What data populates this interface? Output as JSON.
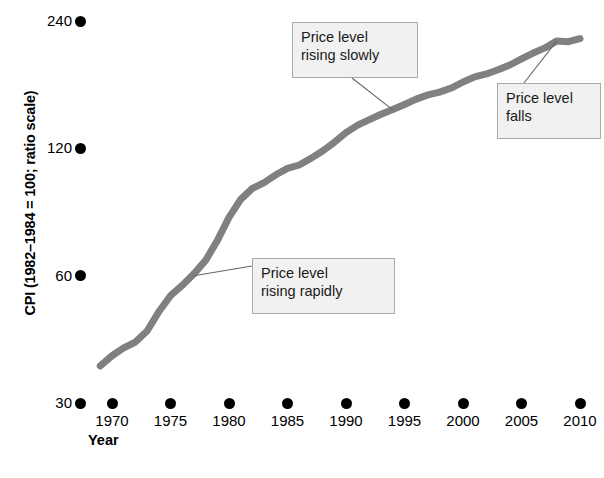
{
  "chart_data": {
    "type": "line",
    "title": "",
    "xlabel": "Year",
    "ylabel": "CPI (1982–1984 = 100; ratio scale)",
    "yscale": "log",
    "ylim": [
      30,
      260
    ],
    "xlim": [
      1969,
      2011
    ],
    "grid": false,
    "legend": null,
    "series": [
      {
        "name": "CPI",
        "color": "#808080",
        "x": [
          1969,
          1970,
          1971,
          1972,
          1973,
          1974,
          1975,
          1976,
          1977,
          1978,
          1979,
          1980,
          1981,
          1982,
          1983,
          1984,
          1985,
          1986,
          1987,
          1988,
          1989,
          1990,
          1991,
          1992,
          1993,
          1994,
          1995,
          1996,
          1997,
          1998,
          1999,
          2000,
          2001,
          2002,
          2003,
          2004,
          2005,
          2006,
          2007,
          2008,
          2009,
          2010
        ],
        "y": [
          36.7,
          38.8,
          40.5,
          41.8,
          44.4,
          49.3,
          53.8,
          56.9,
          60.6,
          65.2,
          72.6,
          82.4,
          90.9,
          96.5,
          99.6,
          103.9,
          107.6,
          109.6,
          113.6,
          118.3,
          124.0,
          130.7,
          136.2,
          140.3,
          144.5,
          148.2,
          152.4,
          156.9,
          160.5,
          163.0,
          166.6,
          172.2,
          177.1,
          179.9,
          184.0,
          188.9,
          195.3,
          201.6,
          207.3,
          215.3,
          214.5,
          218.1
        ],
        "annotations": [
          {
            "text": "Price level\nrising rapidly",
            "attach_year": 1977,
            "attach_value": 60
          },
          {
            "text": "Price level\nrising slowly",
            "attach_year": 1994,
            "attach_value": 148
          },
          {
            "text": "Price level\nfalls",
            "attach_year": 2008,
            "attach_value": 215
          }
        ]
      }
    ],
    "yticks": [
      {
        "value": 30,
        "label": "30"
      },
      {
        "value": 60,
        "label": "60"
      },
      {
        "value": 120,
        "label": "120"
      },
      {
        "value": 240,
        "label": "240"
      }
    ],
    "xticks": [
      {
        "value": 1970,
        "label": "1970"
      },
      {
        "value": 1975,
        "label": "1975"
      },
      {
        "value": 1980,
        "label": "1980"
      },
      {
        "value": 1985,
        "label": "1985"
      },
      {
        "value": 1990,
        "label": "1990"
      },
      {
        "value": 1995,
        "label": "1995"
      },
      {
        "value": 2000,
        "label": "2000"
      },
      {
        "value": 2005,
        "label": "2005"
      },
      {
        "value": 2010,
        "label": "2010"
      }
    ]
  },
  "annotations": {
    "rising_slowly": "Price level\nrising slowly",
    "falls": "Price level\nfalls",
    "rising_rapidly": "Price level\nrising rapidly"
  },
  "axes": {
    "ylabel": "CPI (1982–1984 = 100; ratio scale)",
    "xlabel": "Year"
  },
  "colors": {
    "line": "#808080",
    "tick_dot": "#000000",
    "callout_fill": "#f1f1f1",
    "callout_border": "#a9a9a9",
    "leader_line": "#666666",
    "text": "#000000"
  }
}
